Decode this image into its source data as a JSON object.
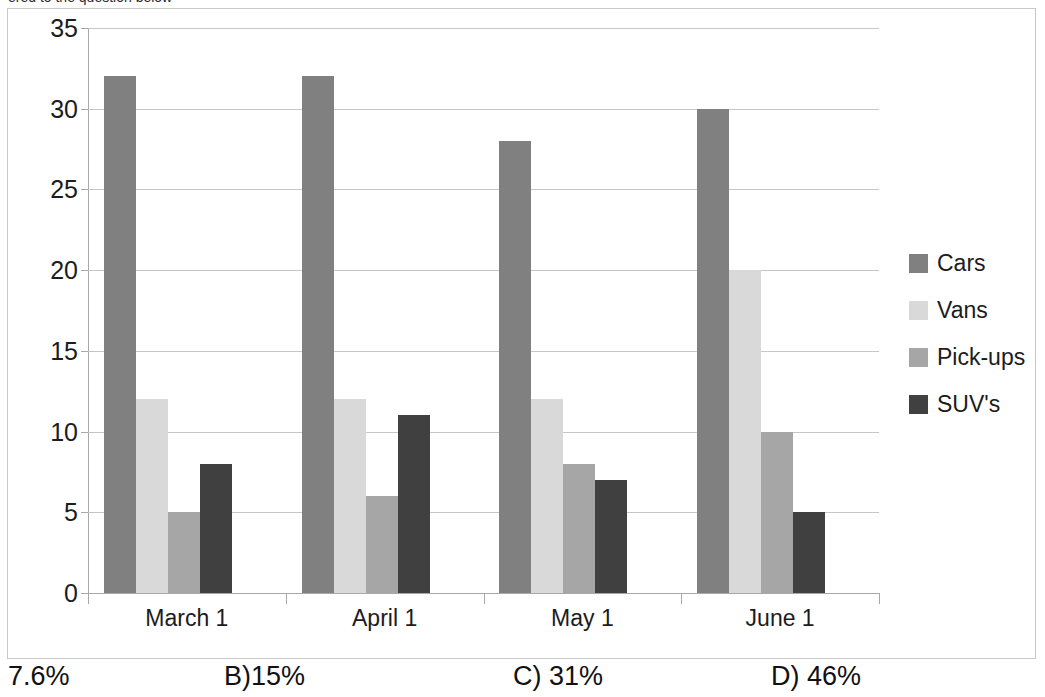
{
  "title": {
    "clipped_text": "ered to the question below",
    "note": "top line of text is cropped off the top of the screenshot"
  },
  "chart_data": {
    "type": "bar",
    "title": "",
    "xlabel": "",
    "ylabel": "",
    "categories": [
      "March 1",
      "April 1",
      "May 1",
      "June 1"
    ],
    "series": [
      {
        "name": "Cars",
        "color": "#808080",
        "values": [
          32,
          32,
          28,
          30
        ]
      },
      {
        "name": "Vans",
        "color": "#d9d9d9",
        "values": [
          12,
          12,
          12,
          20
        ]
      },
      {
        "name": "Pick-ups",
        "color": "#a6a6a6",
        "values": [
          5,
          6,
          8,
          10
        ]
      },
      {
        "name": "SUV's",
        "color": "#404040",
        "values": [
          8,
          11,
          7,
          5
        ]
      }
    ],
    "ylim": [
      0,
      35
    ],
    "yticks": [
      0,
      5,
      10,
      15,
      20,
      25,
      30,
      35
    ],
    "ytick_labels": [
      "0",
      "5",
      "10",
      "15",
      "20",
      "25",
      "30",
      "35"
    ],
    "grid": true,
    "grid_axis": "y",
    "legend_position": "right",
    "bar_style": "grouped"
  },
  "answers": {
    "options": [
      {
        "label": "7.6%",
        "x": 8
      },
      {
        "label": "B)15%",
        "x": 224
      },
      {
        "label": "C) 31%",
        "x": 513
      },
      {
        "label": "D) 46%",
        "x": 771
      }
    ]
  }
}
